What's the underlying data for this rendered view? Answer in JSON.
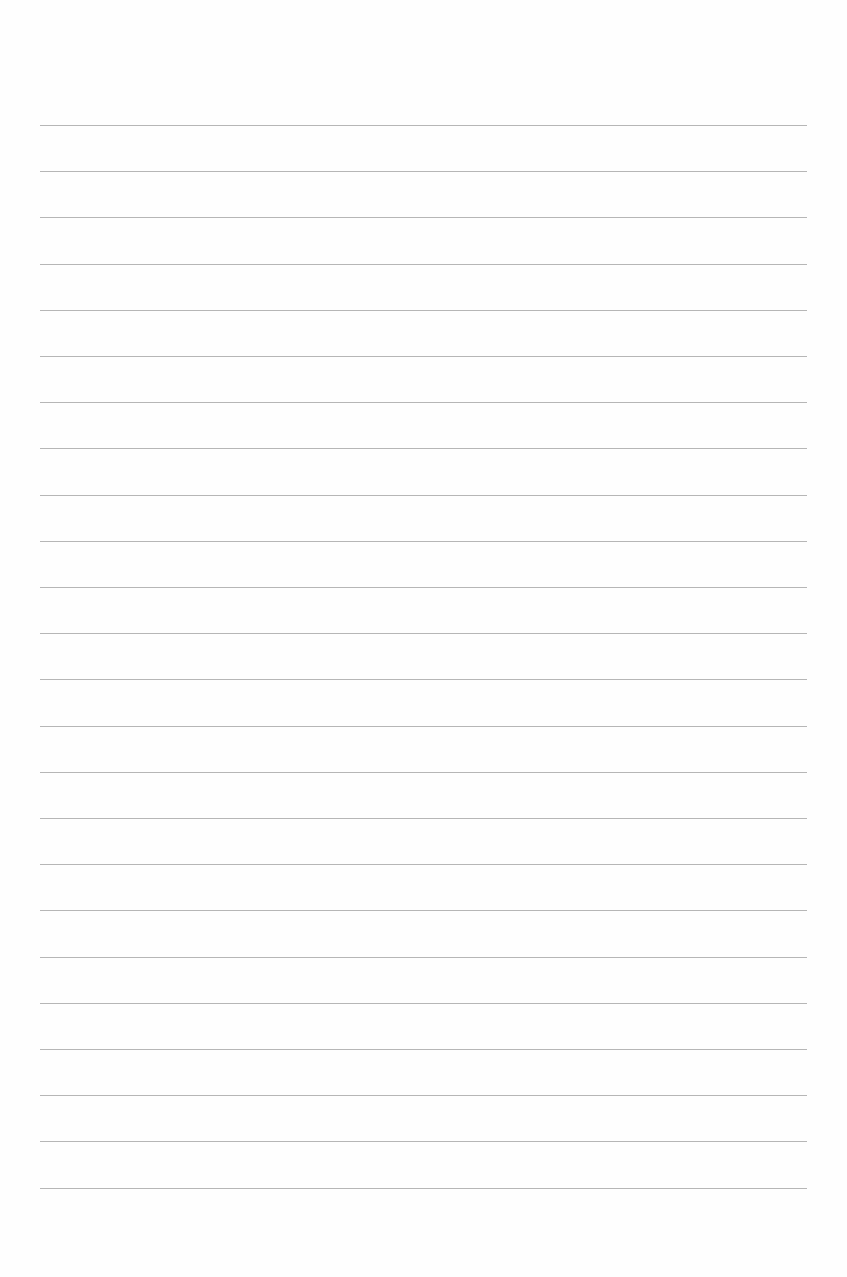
{
  "page": {
    "type": "lined-paper",
    "background_color": "#ffffff",
    "rule_color": "#a9a9a9",
    "rule_count": 24,
    "rule_left": 40,
    "rule_right": 807,
    "first_rule_y": 125,
    "rule_spacing": 46.2,
    "text": ""
  }
}
